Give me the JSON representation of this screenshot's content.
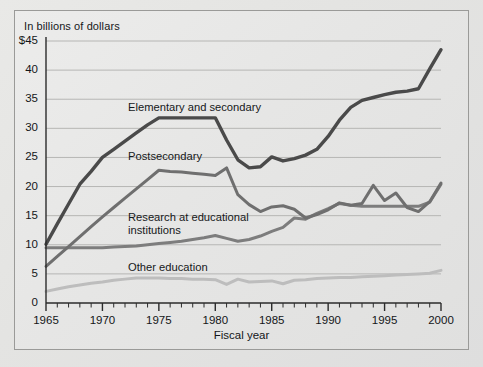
{
  "figure": {
    "unit_note": "In billions of dollars",
    "xaxis_title": "Fiscal year"
  },
  "axes": {
    "y_ticks": [
      "$45",
      "40",
      "35",
      "30",
      "25",
      "20",
      "15",
      "10",
      "5",
      "0"
    ],
    "x_ticks": [
      "1965",
      "1970",
      "1975",
      "1980",
      "1985",
      "1990",
      "1995",
      "2000"
    ]
  },
  "labels": {
    "elementary": "Elementary and secondary",
    "postsecondary": "Postsecondary",
    "research_line1": "Research at educational",
    "research_line2": "institutions",
    "other": "Other education"
  },
  "colors": {
    "elementary": "#4a4a4a",
    "postsecondary": "#6f6f6f",
    "research": "#7d7d7d",
    "other": "#bdbdbd",
    "grid": "#b6b6b4",
    "axis": "#2b2b2b",
    "background": "#e7e7e5"
  },
  "chart_data": {
    "type": "line",
    "title": "",
    "subtitle": "",
    "xlabel": "Fiscal year",
    "ylabel": "In billions of dollars",
    "xlim": [
      1965,
      2000
    ],
    "ylim": [
      0,
      45
    ],
    "y_tick_values": [
      0,
      5,
      10,
      15,
      20,
      25,
      30,
      35,
      40,
      45
    ],
    "x_tick_values": [
      1965,
      1970,
      1975,
      1980,
      1985,
      1990,
      1995,
      2000
    ],
    "x_minor_tick_step": 1,
    "grid": "horizontal",
    "legend": "inline-annotations",
    "x": [
      1965,
      1966,
      1967,
      1968,
      1969,
      1970,
      1971,
      1972,
      1973,
      1974,
      1975,
      1976,
      1977,
      1978,
      1979,
      1980,
      1981,
      1982,
      1983,
      1984,
      1985,
      1986,
      1987,
      1988,
      1989,
      1990,
      1991,
      1992,
      1993,
      1994,
      1995,
      1996,
      1997,
      1998,
      1999,
      2000
    ],
    "series": [
      {
        "name": "Elementary and secondary",
        "color": "#4a4a4a",
        "values": [
          10.1,
          13.6,
          17.0,
          20.4,
          22.6,
          25.0,
          26.4,
          27.8,
          29.2,
          30.6,
          31.8,
          31.8,
          31.8,
          31.8,
          31.8,
          31.8,
          28.0,
          24.6,
          23.2,
          23.4,
          25.1,
          24.4,
          24.8,
          25.4,
          26.4,
          28.6,
          31.4,
          33.6,
          34.8,
          35.3,
          35.8,
          36.2,
          36.4,
          36.8,
          40.2,
          43.5
        ]
      },
      {
        "name": "Postsecondary",
        "color": "#6f6f6f",
        "values": [
          6.3,
          8.0,
          9.7,
          11.4,
          13.1,
          14.8,
          16.4,
          18.0,
          19.6,
          21.2,
          22.8,
          22.6,
          22.5,
          22.3,
          22.1,
          21.9,
          23.2,
          18.6,
          16.9,
          15.7,
          16.5,
          16.7,
          16.1,
          14.6,
          15.2,
          16.0,
          17.2,
          16.8,
          17.1,
          20.2,
          17.6,
          18.9,
          16.4,
          15.7,
          17.4,
          20.6
        ]
      },
      {
        "name": "Research at educational institutions",
        "color": "#7d7d7d",
        "values": [
          9.5,
          9.5,
          9.5,
          9.5,
          9.5,
          9.5,
          9.6,
          9.7,
          9.8,
          10.0,
          10.2,
          10.4,
          10.6,
          10.9,
          11.2,
          11.6,
          11.1,
          10.6,
          10.9,
          11.5,
          12.3,
          13.0,
          14.6,
          14.4,
          15.4,
          16.2,
          17.1,
          16.8,
          16.6,
          16.6,
          16.6,
          16.6,
          16.6,
          16.6,
          17.3,
          20.4
        ]
      },
      {
        "name": "Other education",
        "color": "#bdbdbd",
        "values": [
          2.0,
          2.4,
          2.8,
          3.1,
          3.4,
          3.6,
          3.9,
          4.1,
          4.3,
          4.3,
          4.3,
          4.2,
          4.2,
          4.1,
          4.1,
          4.0,
          3.2,
          4.1,
          3.6,
          3.7,
          3.8,
          3.3,
          3.9,
          4.0,
          4.2,
          4.3,
          4.4,
          4.4,
          4.5,
          4.6,
          4.7,
          4.8,
          4.9,
          5.0,
          5.1,
          5.6
        ]
      }
    ]
  }
}
